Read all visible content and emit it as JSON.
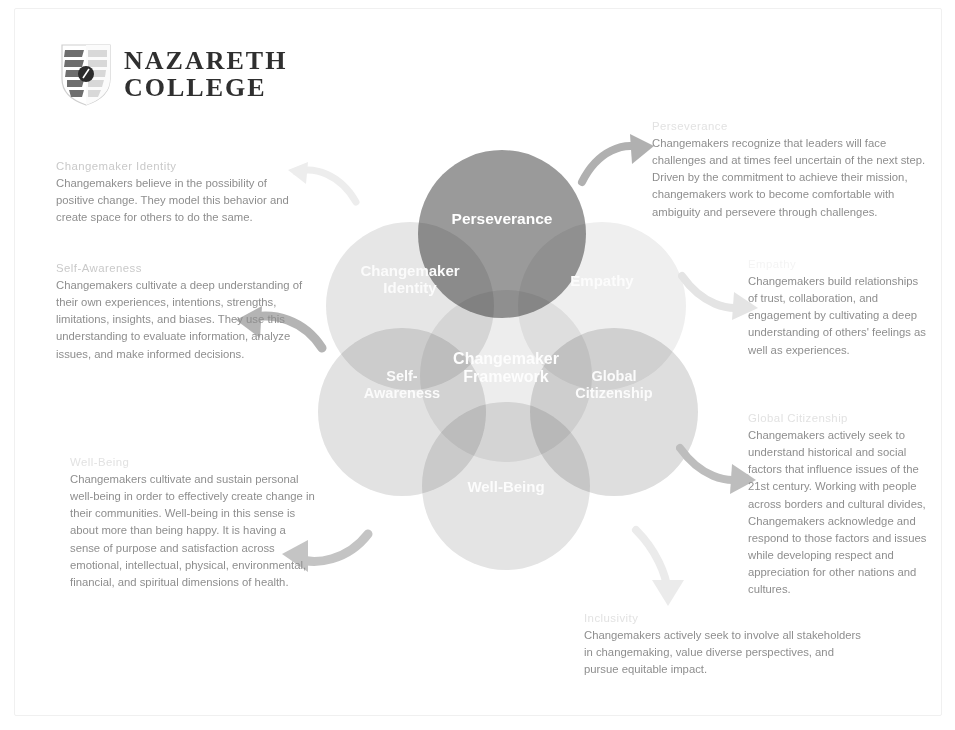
{
  "logo": {
    "line1": "NAZARETH",
    "line2": "COLLEGE",
    "icon": "shield-icon"
  },
  "diagram": {
    "center_label": "Changemaker\nFramework",
    "lobes": [
      {
        "key": "perseverance",
        "label": "Perseverance",
        "color": "#9a9a9a"
      },
      {
        "key": "changemaker-identity",
        "label": "Changemaker\nIdentity",
        "color": "#e6e6e6"
      },
      {
        "key": "empathy",
        "label": "Empathy",
        "color": "#efefef"
      },
      {
        "key": "self-awareness",
        "label": "Self-\nAwareness",
        "color": "#e2e2e2"
      },
      {
        "key": "global-citizenship",
        "label": "Global\nCitizenship",
        "color": "#dedede"
      },
      {
        "key": "well-being",
        "label": "Well-Being",
        "color": "#e4e4e4"
      }
    ]
  },
  "blocks": {
    "changemaker_identity": {
      "heading": "Changemaker Identity",
      "body": "Changemakers believe in the possibility of positive change. They model this behavior and create space for others to do the same."
    },
    "self_awareness": {
      "heading": "Self-Awareness",
      "body": "Changemakers cultivate a deep understanding of their own experiences, intentions, strengths, limitations, insights, and biases. They use this understanding to evaluate information, analyze issues, and make informed decisions."
    },
    "well_being": {
      "heading": "Well-Being",
      "body": "Changemakers cultivate and sustain personal well-being in order to effectively create change in their communities. Well-being in this sense is about more than being happy. It is having a sense of purpose and satisfaction across emotional, intellectual, physical, environmental, financial, and spiritual dimensions of health."
    },
    "perseverance": {
      "heading": "Perseverance",
      "body": "Changemakers recognize that leaders will face challenges and at times feel uncertain of the next step. Driven by the commitment to achieve their mission, changemakers work to become comfortable with ambiguity and persevere through challenges."
    },
    "empathy": {
      "heading": "Empathy",
      "body": "Changemakers build relationships of trust, collaboration, and engagement by cultivating a deep understanding of others' feelings as well as experiences."
    },
    "global_citizenship": {
      "heading": "Global Citizenship",
      "body": "Changemakers actively seek to understand historical and social factors that influence issues of the 21st century. Working with people across borders and cultural divides, Changemakers acknowledge and respond to those factors and issues while developing respect and appreciation for other nations and cultures."
    },
    "inclusivity": {
      "heading": "Inclusivity",
      "body": "Changemakers actively seek to involve all stakeholders in changemaking, value diverse perspectives, and pursue equitable impact."
    }
  },
  "arrows": [
    {
      "name": "arrow-to-changemaker-identity",
      "direction": "left"
    },
    {
      "name": "arrow-to-self-awareness",
      "direction": "left"
    },
    {
      "name": "arrow-to-well-being",
      "direction": "left"
    },
    {
      "name": "arrow-to-perseverance",
      "direction": "right"
    },
    {
      "name": "arrow-to-empathy",
      "direction": "right"
    },
    {
      "name": "arrow-to-global-citizenship",
      "direction": "right"
    },
    {
      "name": "arrow-to-inclusivity",
      "direction": "down"
    }
  ]
}
